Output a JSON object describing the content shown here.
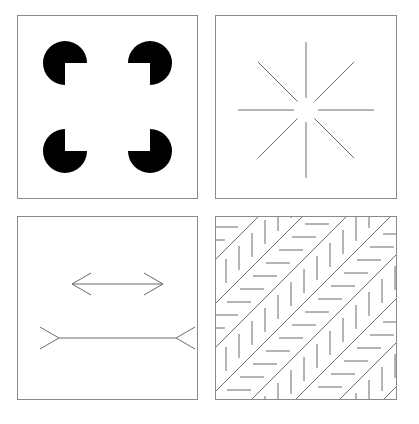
{
  "figure": {
    "background_color": "#ffffff",
    "panel_border_color": "#8a8a8a",
    "panel_border_width": 1,
    "stroke_color": "#6b6b6b",
    "ink_color": "#000000",
    "columns": 2,
    "rows": 2,
    "panel_count": 4
  },
  "panels": [
    {
      "id": "kanizsa",
      "name": "Kanizsa square",
      "position": "top-left",
      "box": {
        "x": 17,
        "y": 15,
        "width": 181,
        "height": 184
      },
      "description": "Four black pac-man discs with wedges cut facing the centre, producing an illusory white square.",
      "fill_color": "#000000",
      "disc_radius": 22,
      "wedge_angle_degrees": 90,
      "inducers": [
        {
          "label": "top-left-pacman",
          "cx": 48,
          "cy": 48,
          "wedge_facing": "bottom-right",
          "wedge_start_deg": 0,
          "wedge_end_deg": 90
        },
        {
          "label": "top-right-pacman",
          "cx": 133,
          "cy": 48,
          "wedge_facing": "bottom-left",
          "wedge_start_deg": 90,
          "wedge_end_deg": 180
        },
        {
          "label": "bottom-left-pacman",
          "cx": 48,
          "cy": 136,
          "wedge_facing": "top-right",
          "wedge_start_deg": 270,
          "wedge_end_deg": 360
        },
        {
          "label": "bottom-right-pacman",
          "cx": 133,
          "cy": 136,
          "wedge_facing": "top-left",
          "wedge_start_deg": 180,
          "wedge_end_deg": 270
        }
      ]
    },
    {
      "id": "ehrenstein",
      "name": "Ehrenstein radiating lines",
      "position": "top-right",
      "box": {
        "x": 215,
        "y": 15,
        "width": 182,
        "height": 184
      },
      "description": "Eight straight lines radiating from a common centre, each stopping short of the centre to leave a circular gap that appears as a bright disc.",
      "stroke_color": "#6b6b6b",
      "stroke_width": 1,
      "center": {
        "cx": 91,
        "cy": 95
      },
      "inner_gap_radius": 12,
      "outer_radius": 68,
      "ray_count": 8,
      "ray_angles_degrees": [
        0,
        45,
        90,
        135,
        180,
        225,
        270,
        315
      ]
    },
    {
      "id": "muller-lyer",
      "name": "Muller-Lyer illusion",
      "position": "bottom-left",
      "box": {
        "x": 17,
        "y": 216,
        "width": 181,
        "height": 184
      },
      "description": "Two shafts of equal length; the upper shaft carries outward-pointing arrowheads, the lower shaft carries inward-pointing fins, so the lower appears longer.",
      "stroke_color": "#6b6b6b",
      "stroke_width": 1,
      "shafts": [
        {
          "label": "upper-shaft-arrowheads-out",
          "x1": 55,
          "y1": 68,
          "x2": 146,
          "y2": 68,
          "fin_style": "arrowheads-pointing-outward",
          "fin_length": 22,
          "fin_spread_degrees": 30,
          "apparent_length": "shorter"
        },
        {
          "label": "lower-shaft-fins-in",
          "x1": 42,
          "y1": 122,
          "x2": 159,
          "y2": 122,
          "fin_style": "fins-pointing-inward",
          "fin_length": 22,
          "fin_spread_degrees": 30,
          "apparent_length": "longer"
        }
      ]
    },
    {
      "id": "zollner",
      "name": "Zollner illusion",
      "position": "bottom-right",
      "box": {
        "x": 215,
        "y": 216,
        "width": 182,
        "height": 184
      },
      "description": "Long parallel diagonals rising to the right, crossed by short hatch marks that alternate between horizontal and vertical from band to band, making the diagonals appear to converge.",
      "stroke_color": "#6b6b6b",
      "diagonal_stroke_width": 1,
      "hatch_stroke_width": 1,
      "diagonal_direction": "up-to-the-right",
      "diagonal_count": 7,
      "diagonal_spacing": 44,
      "hatch_length": 24,
      "hatch_spacing": 13,
      "hatch_orientations": [
        "horizontal",
        "vertical"
      ]
    }
  ]
}
